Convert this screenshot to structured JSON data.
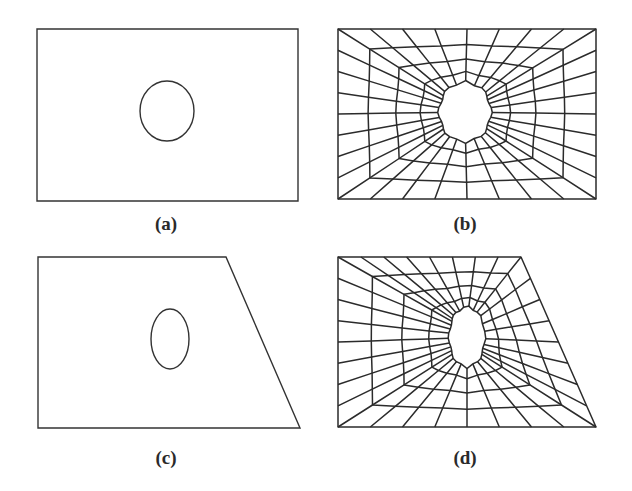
{
  "figure": {
    "panels": [
      {
        "id": "a",
        "label": "(a)",
        "label_pos": [
          166,
          213
        ],
        "description": "Rectangular domain with circular hole",
        "boundary": [
          [
            37,
            29
          ],
          [
            298,
            29
          ],
          [
            298,
            201
          ],
          [
            37,
            201
          ]
        ],
        "hole": {
          "cx": 167,
          "cy": 111,
          "rx": 27,
          "ry": 30
        }
      },
      {
        "id": "b",
        "label": "(b)",
        "label_pos": [
          465,
          213
        ],
        "description": "Quadrilateral mesh of rectangular domain around octagonal hole",
        "boundary": [
          [
            338,
            29
          ],
          [
            596,
            29
          ],
          [
            596,
            199
          ],
          [
            338,
            199
          ]
        ],
        "hole": {
          "cx": 465,
          "cy": 112,
          "rx": 26,
          "ry": 30
        },
        "rings": 5,
        "nodes_per_ring": 32
      },
      {
        "id": "c",
        "label": "(c)",
        "label_pos": [
          166,
          447
        ],
        "description": "Trapezoidal domain with elliptical hole",
        "boundary": [
          [
            38,
            257
          ],
          [
            226,
            257
          ],
          [
            300,
            428
          ],
          [
            38,
            428
          ]
        ],
        "hole": {
          "cx": 170,
          "cy": 339,
          "rx": 19,
          "ry": 30
        }
      },
      {
        "id": "d",
        "label": "(d)",
        "label_pos": [
          465,
          447
        ],
        "description": "Quadrilateral mesh of trapezoidal domain around elliptical hole",
        "boundary": [
          [
            338,
            257
          ],
          [
            521,
            257
          ],
          [
            596,
            427
          ],
          [
            338,
            427
          ]
        ],
        "hole": {
          "cx": 467,
          "cy": 337,
          "rx": 18,
          "ry": 30
        },
        "rings": 5,
        "nodes_per_ring": 32
      }
    ],
    "colors": {
      "line": "#2b2b2b",
      "background": "#ffffff"
    }
  }
}
